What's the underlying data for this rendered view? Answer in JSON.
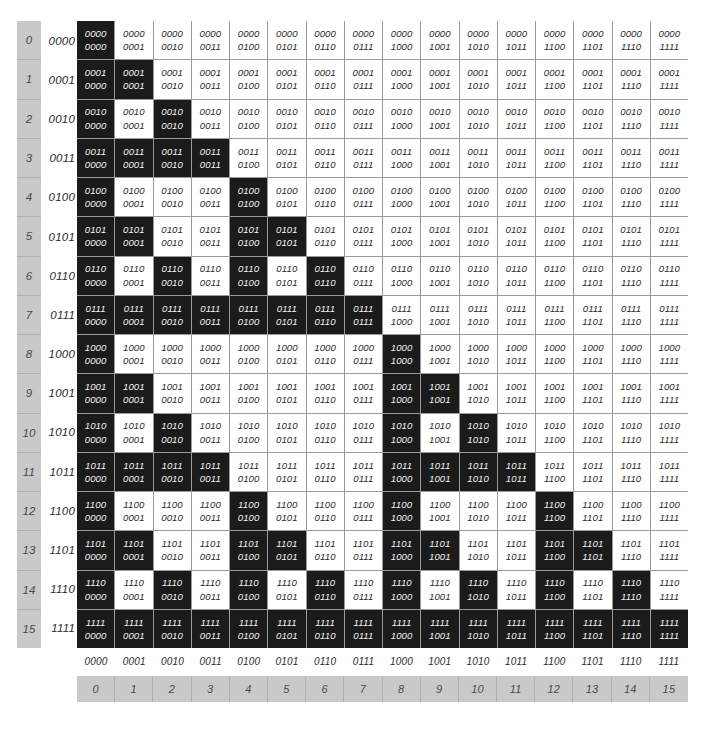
{
  "chart_data": {
    "type": "heatmap",
    "title": "",
    "xlabel": "",
    "ylabel": "",
    "rule": "(row AND col) == col",
    "categories": [
      "0000",
      "0001",
      "0010",
      "0011",
      "0100",
      "0101",
      "0110",
      "0111",
      "1000",
      "1001",
      "1010",
      "1011",
      "1100",
      "1101",
      "1110",
      "1111"
    ],
    "row_decimal_labels": [
      "0",
      "1",
      "2",
      "3",
      "4",
      "5",
      "6",
      "7",
      "8",
      "9",
      "10",
      "11",
      "12",
      "13",
      "14",
      "15"
    ],
    "row_binary_labels": [
      "0000",
      "0001",
      "0010",
      "0011",
      "0100",
      "0101",
      "0110",
      "0111",
      "1000",
      "1001",
      "1010",
      "1011",
      "1100",
      "1101",
      "1110",
      "1111"
    ],
    "col_decimal_labels": [
      "0",
      "1",
      "2",
      "3",
      "4",
      "5",
      "6",
      "7",
      "8",
      "9",
      "10",
      "11",
      "12",
      "13",
      "14",
      "15"
    ],
    "col_binary_labels": [
      "0000",
      "0001",
      "0010",
      "0011",
      "0100",
      "0101",
      "0110",
      "0111",
      "1000",
      "1001",
      "1010",
      "1011",
      "1100",
      "1101",
      "1110",
      "1111"
    ],
    "values": [
      [
        1,
        0,
        0,
        0,
        0,
        0,
        0,
        0,
        0,
        0,
        0,
        0,
        0,
        0,
        0,
        0
      ],
      [
        1,
        1,
        0,
        0,
        0,
        0,
        0,
        0,
        0,
        0,
        0,
        0,
        0,
        0,
        0,
        0
      ],
      [
        1,
        0,
        1,
        0,
        0,
        0,
        0,
        0,
        0,
        0,
        0,
        0,
        0,
        0,
        0,
        0
      ],
      [
        1,
        1,
        1,
        1,
        0,
        0,
        0,
        0,
        0,
        0,
        0,
        0,
        0,
        0,
        0,
        0
      ],
      [
        1,
        0,
        0,
        0,
        1,
        0,
        0,
        0,
        0,
        0,
        0,
        0,
        0,
        0,
        0,
        0
      ],
      [
        1,
        1,
        0,
        0,
        1,
        1,
        0,
        0,
        0,
        0,
        0,
        0,
        0,
        0,
        0,
        0
      ],
      [
        1,
        0,
        1,
        0,
        1,
        0,
        1,
        0,
        0,
        0,
        0,
        0,
        0,
        0,
        0,
        0
      ],
      [
        1,
        1,
        1,
        1,
        1,
        1,
        1,
        1,
        0,
        0,
        0,
        0,
        0,
        0,
        0,
        0
      ],
      [
        1,
        0,
        0,
        0,
        0,
        0,
        0,
        0,
        1,
        0,
        0,
        0,
        0,
        0,
        0,
        0
      ],
      [
        1,
        1,
        0,
        0,
        0,
        0,
        0,
        0,
        1,
        1,
        0,
        0,
        0,
        0,
        0,
        0
      ],
      [
        1,
        0,
        1,
        0,
        0,
        0,
        0,
        0,
        1,
        0,
        1,
        0,
        0,
        0,
        0,
        0
      ],
      [
        1,
        1,
        1,
        1,
        0,
        0,
        0,
        0,
        1,
        1,
        1,
        1,
        0,
        0,
        0,
        0
      ],
      [
        1,
        0,
        0,
        0,
        1,
        0,
        0,
        0,
        1,
        0,
        0,
        0,
        1,
        0,
        0,
        0
      ],
      [
        1,
        1,
        0,
        0,
        1,
        1,
        0,
        0,
        1,
        1,
        0,
        0,
        1,
        1,
        0,
        0
      ],
      [
        1,
        0,
        1,
        0,
        1,
        0,
        1,
        0,
        1,
        0,
        1,
        0,
        1,
        0,
        1,
        0
      ],
      [
        1,
        1,
        1,
        1,
        1,
        1,
        1,
        1,
        1,
        1,
        1,
        1,
        1,
        1,
        1,
        1
      ]
    ],
    "colors": {
      "cell_on_background": "#1b1b1b",
      "cell_on_text": "#f2f2f2",
      "cell_off_background": "#ffffff",
      "cell_off_text": "#2a2a2a",
      "grid_line": "#9a9a9a",
      "axis_strip_background": "#c9c9c9",
      "axis_strip_text": "#4a4a4a",
      "page_background": "#ffffff"
    },
    "legend": [],
    "grid": true
  }
}
